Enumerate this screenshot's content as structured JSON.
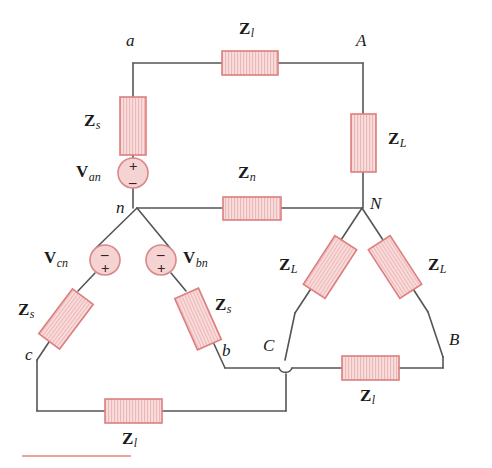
{
  "figure": {
    "background_color": "#ffffff",
    "wire_color": "#555555",
    "component_fill": "#f9dede",
    "component_hatch": "#eeb5b5",
    "component_border": "#dd7f7f",
    "source_fill": "#f6d3d3",
    "source_border": "#d98888",
    "text_color": "#1a1a1a",
    "rule_color": "#e7a7a0"
  },
  "nodes": [
    {
      "id": "a",
      "label": "a",
      "x": 133,
      "y": 63
    },
    {
      "id": "A",
      "label": "A",
      "x": 363,
      "y": 63
    },
    {
      "id": "n",
      "label": "n",
      "x": 137,
      "y": 208
    },
    {
      "id": "N",
      "label": "N",
      "x": 362,
      "y": 208
    },
    {
      "id": "b",
      "label": "b",
      "x": 225,
      "y": 368
    },
    {
      "id": "B",
      "label": "B",
      "x": 443,
      "y": 365
    },
    {
      "id": "c",
      "label": "c",
      "x": 37,
      "y": 360
    },
    {
      "id": "C",
      "label": "C",
      "x": 285,
      "y": 368
    }
  ],
  "impedances": [
    {
      "id": "zl-top",
      "symbol": "Z",
      "subscript": "l",
      "label": "Zl",
      "branch": "a-A"
    },
    {
      "id": "zs-top",
      "symbol": "Z",
      "subscript": "s",
      "label": "Zs",
      "branch": "a-source-an"
    },
    {
      "id": "zn",
      "symbol": "Z",
      "subscript": "n",
      "label": "Zn",
      "branch": "n-N"
    },
    {
      "id": "zL-right-top",
      "symbol": "Z",
      "subscript": "L",
      "label": "ZL",
      "branch": "A-N"
    },
    {
      "id": "zL-left-lower",
      "symbol": "Z",
      "subscript": "L",
      "label": "ZL",
      "branch": "N-C"
    },
    {
      "id": "zL-right-lower",
      "symbol": "Z",
      "subscript": "L",
      "label": "ZL",
      "branch": "N-B"
    },
    {
      "id": "zs-left",
      "symbol": "Z",
      "subscript": "s",
      "label": "Zs",
      "branch": "Vcn-c"
    },
    {
      "id": "zs-right",
      "symbol": "Z",
      "subscript": "s",
      "label": "Zs",
      "branch": "Vbn-b"
    },
    {
      "id": "zl-bottom",
      "symbol": "Z",
      "subscript": "l",
      "label": "Zl",
      "branch": "c-C"
    },
    {
      "id": "zl-bottom-right",
      "symbol": "Z",
      "subscript": "l",
      "label": "Zl",
      "branch": "C-B"
    }
  ],
  "sources": [
    {
      "id": "van",
      "symbol": "V",
      "subscript": "an",
      "label": "Van",
      "top_sign": "+",
      "bottom_sign": "–",
      "cx": 150,
      "cy": 173
    },
    {
      "id": "vcn",
      "symbol": "V",
      "subscript": "cn",
      "label": "Vcn",
      "top_sign": "–",
      "bottom_sign": "+",
      "cx": 105,
      "cy": 260
    },
    {
      "id": "vbn",
      "symbol": "V",
      "subscript": "bn",
      "label": "Vbn",
      "top_sign": "–",
      "bottom_sign": "+",
      "cx": 161,
      "cy": 260
    }
  ],
  "labels": {
    "node_a": "a",
    "node_A": "A",
    "node_n": "n",
    "node_N": "N",
    "node_b": "b",
    "node_B": "B",
    "node_c": "c",
    "node_C": "C",
    "z_symbol": "Z",
    "v_symbol": "V",
    "sub_l": "l",
    "sub_s": "s",
    "sub_n": "n",
    "sub_L": "L",
    "sub_an": "an",
    "sub_bn": "bn",
    "sub_cn": "cn",
    "plus": "+",
    "minus": "–"
  }
}
